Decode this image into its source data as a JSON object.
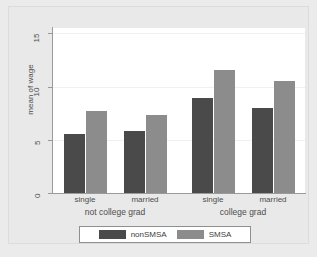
{
  "chart_data": {
    "type": "bar",
    "title": "",
    "subtitle": "",
    "xlabel": "",
    "ylabel": "mean of wage",
    "ylim": [
      0,
      15.5
    ],
    "yticks": [
      0,
      5,
      10,
      15
    ],
    "ytick_labels": [
      "0",
      "5",
      "10",
      "15"
    ],
    "grid": true,
    "grid_axis": "y",
    "legend_position": "bottom",
    "categories": [
      "single",
      "married",
      "single",
      "married"
    ],
    "group_labels": [
      "not college grad",
      "college grad"
    ],
    "groups": [
      {
        "label": "not college grad",
        "categories": [
          "single",
          "married"
        ]
      },
      {
        "label": "college grad",
        "categories": [
          "single",
          "married"
        ]
      }
    ],
    "series": [
      {
        "name": "nonSMSA",
        "color": "#4a4a4a",
        "values": [
          5.5,
          5.8,
          8.9,
          8.0
        ]
      },
      {
        "name": "SMSA",
        "color": "#8c8c8c",
        "values": [
          7.7,
          7.3,
          11.6,
          10.5
        ]
      }
    ],
    "colors": {
      "nonSMSA": "#4a4a4a",
      "SMSA": "#8c8c8c",
      "plot_background": "#ffffff",
      "figure_background": "#e9e9e9",
      "axis": "#9a9a9a",
      "gridline": "#f0f0f0",
      "text": "#4d4d4d"
    }
  },
  "legend": {
    "items": [
      {
        "label": "nonSMSA",
        "color": "#4a4a4a"
      },
      {
        "label": "SMSA",
        "color": "#8c8c8c"
      }
    ]
  },
  "axis": {
    "y_title": "mean of wage",
    "y_tick_0": "0",
    "y_tick_1": "5",
    "y_tick_2": "10",
    "y_tick_3": "15"
  },
  "xaxis": {
    "tick_labels": [
      "single",
      "married",
      "single",
      "married"
    ],
    "group_labels": [
      "not college grad",
      "college grad"
    ]
  }
}
